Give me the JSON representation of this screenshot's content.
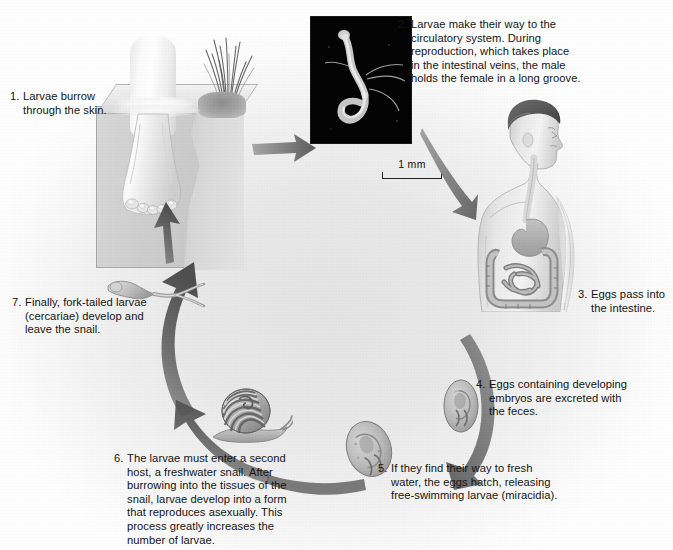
{
  "figure": {
    "background_color": "#e9e9e9",
    "ink_color": "#151515",
    "arrow_color": "#6e6e6e"
  },
  "steps": [
    {
      "number": "1.",
      "text": "Larvae burrow through the skin.",
      "lines": [
        "Larvae burrow",
        "through the skin."
      ]
    },
    {
      "number": "2.",
      "text": "Larvae make their way to the circulatory system. During reproduction, which takes place in the intestinal veins, the male holds the female in a long groove.",
      "lines": [
        "Larvae make their way to the",
        "circulatory system. During",
        "reproduction, which takes place",
        "in the intestinal veins, the male",
        "holds the female in a long groove."
      ]
    },
    {
      "number": "3.",
      "text": "Eggs pass into the intestine.",
      "lines": [
        "Eggs pass into",
        "the intestine."
      ]
    },
    {
      "number": "4.",
      "text": "Eggs containing developing embryos are excreted with the feces.",
      "lines": [
        "Eggs containing developing",
        "embryos are excreted with",
        "the feces."
      ]
    },
    {
      "number": "5.",
      "text": "If they find their way to fresh water, the eggs hatch, releasing free-swimming larvae (miracidia).",
      "lines": [
        "If they find their way to fresh",
        "water, the eggs hatch, releasing",
        "free-swimming larvae (miracidia)."
      ]
    },
    {
      "number": "6.",
      "text": "The larvae must enter a second host, a freshwater snail. After burrowing into the tissues of the snail, larvae develop into a form that reproduces asexually. This process greatly increases the number of larvae.",
      "lines": [
        "The larvae must enter a second",
        "host, a freshwater snail. After",
        "burrowing into the tissues of the",
        "snail, larvae develop into a form",
        "that reproduces asexually. This",
        "process greatly increases the",
        "number of larvae."
      ]
    },
    {
      "number": "7.",
      "text": "Finally, fork-tailed larvae (cercariae) develop and leave the snail.",
      "lines": [
        "Finally, fork-tailed larvae",
        "(cercariae) develop and",
        "leave the snail."
      ]
    }
  ],
  "micrograph": {
    "scale_label": "1 mm",
    "subject": "paired male and female schistosome worms",
    "background_color": "#030303"
  },
  "illustrations": {
    "water_box": "foot standing in water, cut-away bank with grass",
    "human": "human torso showing digestive tract",
    "snail": "freshwater snail with banded shell",
    "cercaria": "fork-tailed cercaria larva",
    "egg_upper": "schistosome egg with developing embryo",
    "egg_lower": "schistosome egg with developing embryo"
  }
}
